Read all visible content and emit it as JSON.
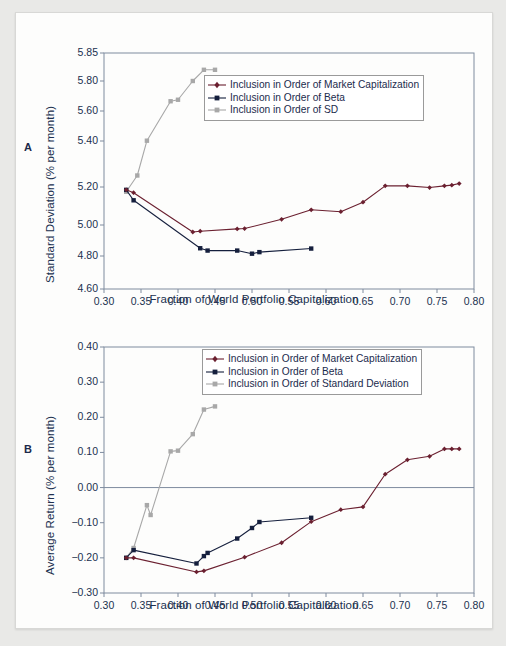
{
  "figure": {
    "background": "#e9e9e7",
    "page_background": "#fdfdfc",
    "colors": {
      "market_cap": "#6b2030",
      "beta": "#151f3d",
      "sd": "#a8a8a8",
      "axis": "#7e8b9e",
      "text": "#20304f"
    }
  },
  "panels": [
    {
      "letter": "A",
      "xlabel": "Fraction of World Portfolio Capitalization",
      "ylabel": "Standard Deviation (% per month)",
      "xticks": [
        "0.30",
        "0.35",
        "0.40",
        "0.45",
        "0.50",
        "0.55",
        "0.60",
        "0.65",
        "0.70",
        "0.75",
        "0.80"
      ],
      "yticks": [
        "4.60",
        "4.80",
        "5.00",
        "5.20",
        "5.40",
        "5.60",
        "5.80",
        "5.85"
      ],
      "legend": [
        "Inclusion in Order of Market Capitalization",
        "Inclusion in Order of Beta",
        "Inclusion in Order of SD"
      ]
    },
    {
      "letter": "B",
      "xlabel": "Fraction of World Portfolio Capitalization",
      "ylabel": "Average Return (% per month)",
      "xticks": [
        "0.30",
        "0.35",
        "0.40",
        "0.45",
        "0.50",
        "0.55",
        "0.60",
        "0.65",
        "0.70",
        "0.75",
        "0.80"
      ],
      "yticks": [
        "−0.30",
        "−0.20",
        "−0.10",
        "0.00",
        "0.10",
        "0.20",
        "0.30",
        "0.40"
      ],
      "legend": [
        "Inclusion in Order of Market Capitalization",
        "Inclusion in Order of Beta",
        "Inclusion in Order of Standard Deviation"
      ]
    }
  ],
  "chart_data": [
    {
      "type": "line",
      "panel": "A",
      "title": "",
      "xlabel": "Fraction of World Portfolio Capitalization",
      "ylabel": "Standard Deviation (% per month)",
      "xlim": [
        0.3,
        0.8
      ],
      "ylim": [
        4.6,
        5.85
      ],
      "y_axis_note": "non-linear / broken axis: ticks 4.60,4.80,5.00,5.20,5.40,5.60,5.80,5.85 are not evenly spaced in value",
      "ytick_values": [
        4.6,
        4.8,
        5.0,
        5.2,
        5.4,
        5.6,
        5.8,
        5.85
      ],
      "xtick_values": [
        0.3,
        0.35,
        0.4,
        0.45,
        0.5,
        0.55,
        0.6,
        0.65,
        0.7,
        0.75,
        0.8
      ],
      "grid": false,
      "legend_position": "upper center",
      "series": [
        {
          "name": "Inclusion in Order of Market Capitalization",
          "color": "#6b2030",
          "marker": "diamond",
          "x": [
            0.33,
            0.34,
            0.42,
            0.43,
            0.48,
            0.49,
            0.54,
            0.58,
            0.62,
            0.65,
            0.68,
            0.71,
            0.74,
            0.76,
            0.77,
            0.78
          ],
          "y": [
            5.185,
            5.17,
            4.955,
            4.96,
            4.975,
            4.977,
            5.03,
            5.08,
            5.07,
            5.12,
            5.205,
            5.205,
            5.197,
            5.205,
            5.208,
            5.215
          ]
        },
        {
          "name": "Inclusion in Order of Beta",
          "color": "#151f3d",
          "marker": "square",
          "x": [
            0.33,
            0.34,
            0.43,
            0.44,
            0.48,
            0.5,
            0.51,
            0.58
          ],
          "y": [
            5.185,
            5.13,
            4.85,
            4.835,
            4.835,
            4.815,
            4.825,
            4.848
          ]
        },
        {
          "name": "Inclusion in Order of SD",
          "color": "#a8a8a8",
          "marker": "square",
          "x": [
            0.33,
            0.345,
            0.358,
            0.39,
            0.4,
            0.42,
            0.435,
            0.45
          ],
          "y": [
            5.175,
            5.25,
            5.402,
            5.665,
            5.675,
            5.8,
            5.82,
            5.82
          ]
        }
      ]
    },
    {
      "type": "line",
      "panel": "B",
      "title": "",
      "xlabel": "Fraction of World Portfolio Capitalization",
      "ylabel": "Average Return (% per month)",
      "xlim": [
        0.3,
        0.8
      ],
      "ylim": [
        -0.3,
        0.4
      ],
      "ytick_values": [
        -0.3,
        -0.2,
        -0.1,
        0.0,
        0.1,
        0.2,
        0.3,
        0.4
      ],
      "xtick_values": [
        0.3,
        0.35,
        0.4,
        0.45,
        0.5,
        0.55,
        0.6,
        0.65,
        0.7,
        0.75,
        0.8
      ],
      "grid": false,
      "zero_line": true,
      "legend_position": "upper right",
      "series": [
        {
          "name": "Inclusion in Order of Market Capitalization",
          "color": "#6b2030",
          "marker": "diamond",
          "x": [
            0.33,
            0.34,
            0.425,
            0.435,
            0.49,
            0.54,
            0.58,
            0.62,
            0.65,
            0.68,
            0.71,
            0.74,
            0.76,
            0.77,
            0.78
          ],
          "y": [
            -0.2,
            -0.2,
            -0.24,
            -0.237,
            -0.198,
            -0.157,
            -0.097,
            -0.063,
            -0.055,
            0.038,
            0.079,
            0.089,
            0.11,
            0.11,
            0.11
          ]
        },
        {
          "name": "Inclusion in Order of Beta",
          "color": "#151f3d",
          "marker": "square",
          "x": [
            0.33,
            0.34,
            0.425,
            0.435,
            0.44,
            0.48,
            0.5,
            0.51,
            0.58
          ],
          "y": [
            -0.2,
            -0.178,
            -0.216,
            -0.195,
            -0.186,
            -0.145,
            -0.115,
            -0.098,
            -0.086
          ]
        },
        {
          "name": "Inclusion in Order of Standard Deviation",
          "color": "#a8a8a8",
          "marker": "square",
          "x": [
            0.33,
            0.34,
            0.358,
            0.363,
            0.39,
            0.4,
            0.42,
            0.435,
            0.45
          ],
          "y": [
            -0.2,
            -0.172,
            -0.05,
            -0.078,
            0.103,
            0.105,
            0.152,
            0.222,
            0.231
          ]
        }
      ]
    }
  ]
}
